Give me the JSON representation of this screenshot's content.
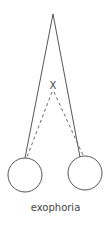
{
  "diagram": {
    "caption": "exophoria",
    "fixation_marker": "X",
    "elements": {
      "visual_axes": "solid lines converging to distant fixation point",
      "deviated_axes": "dashed lines converging to near point X",
      "eyes": [
        "left-eye",
        "right-eye"
      ]
    },
    "colors": {
      "stroke": "#555555",
      "text": "#444444",
      "background": "#ffffff"
    }
  }
}
